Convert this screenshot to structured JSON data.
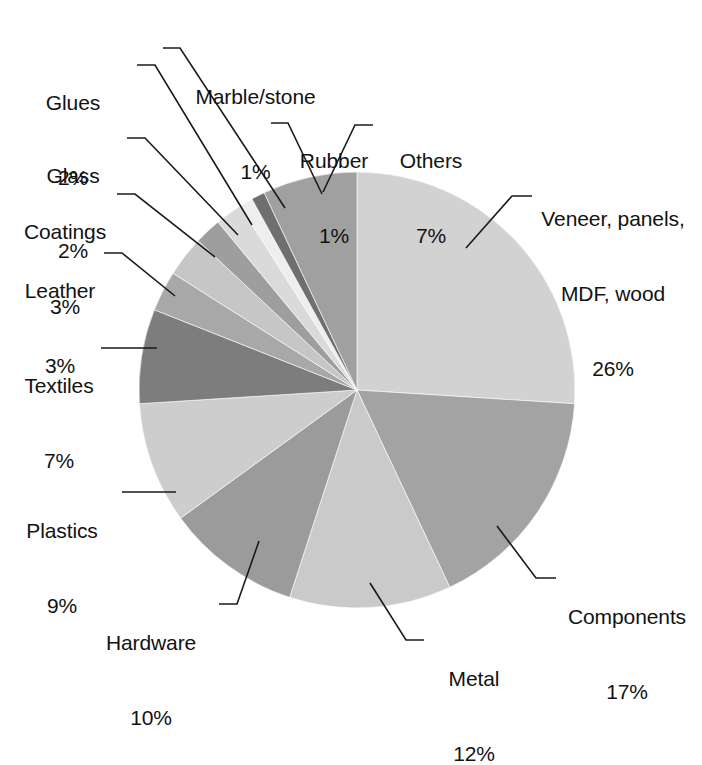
{
  "chart_data": {
    "type": "pie",
    "title": "",
    "subtitle": "",
    "xlabel": "",
    "ylabel": "",
    "legend_position": "none",
    "grid": false,
    "value_unit": "%",
    "categories": [
      "Veneer, panels, MDF, wood",
      "Components",
      "Metal",
      "Hardware",
      "Plastics",
      "Textiles",
      "Leather",
      "Coatings",
      "Glass",
      "Glues",
      "Marble/stone",
      "Rubber",
      "Others"
    ],
    "values": [
      26,
      17,
      12,
      10,
      9,
      7,
      3,
      3,
      2,
      2,
      1,
      1,
      7
    ],
    "slices": [
      {
        "name": "Veneer, panels, MDF, wood",
        "label_line1": "Veneer, panels,",
        "label_line2": "MDF, wood",
        "value": 26,
        "value_label": "26%",
        "color": "#d2d2d2"
      },
      {
        "name": "Components",
        "label_line1": "Components",
        "label_line2": "",
        "value": 17,
        "value_label": "17%",
        "color": "#a3a3a3"
      },
      {
        "name": "Metal",
        "label_line1": "Metal",
        "label_line2": "",
        "value": 12,
        "value_label": "12%",
        "color": "#cacaca"
      },
      {
        "name": "Hardware",
        "label_line1": "Hardware",
        "label_line2": "",
        "value": 10,
        "value_label": "10%",
        "color": "#9b9b9b"
      },
      {
        "name": "Plastics",
        "label_line1": "Plastics",
        "label_line2": "",
        "value": 9,
        "value_label": "9%",
        "color": "#cdcdcd"
      },
      {
        "name": "Textiles",
        "label_line1": "Textiles",
        "label_line2": "",
        "value": 7,
        "value_label": "7%",
        "color": "#7d7d7d"
      },
      {
        "name": "Leather",
        "label_line1": "Leather",
        "label_line2": "",
        "value": 3,
        "value_label": "3%",
        "color": "#a8a8a8"
      },
      {
        "name": "Coatings",
        "label_line1": "Coatings",
        "label_line2": "",
        "value": 3,
        "value_label": "3%",
        "color": "#c6c6c6"
      },
      {
        "name": "Glass",
        "label_line1": "Glass",
        "label_line2": "",
        "value": 2,
        "value_label": "2%",
        "color": "#9e9e9e"
      },
      {
        "name": "Glues",
        "label_line1": "Glues",
        "label_line2": "",
        "value": 2,
        "value_label": "2%",
        "color": "#dadada"
      },
      {
        "name": "Marble/stone",
        "label_line1": "Marble/stone",
        "label_line2": "",
        "value": 1,
        "value_label": "1%",
        "color": "#eeeeee"
      },
      {
        "name": "Rubber",
        "label_line1": "Rubber",
        "label_line2": "",
        "value": 1,
        "value_label": "1%",
        "color": "#6f6f6f"
      },
      {
        "name": "Others",
        "label_line1": "Others",
        "label_line2": "",
        "value": 7,
        "value_label": "7%",
        "color": "#a0a0a0"
      }
    ],
    "geometry": {
      "center_x": 357,
      "center_y": 390,
      "radius": 218,
      "start_angle_deg": 0,
      "direction": "clockwise"
    },
    "background_color": "#ffffff",
    "text_color": "#121212",
    "leader_line_color": "#1a1a1a"
  }
}
